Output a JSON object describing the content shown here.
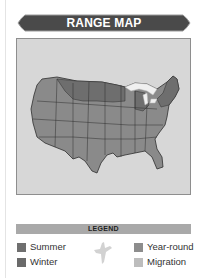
{
  "header": {
    "title": "RANGE MAP"
  },
  "map": {
    "region": "United States (contiguous)",
    "highlighted_areas": [
      "northern-plains",
      "great-lakes",
      "northeast"
    ],
    "colors": {
      "base": "#8a8a8a",
      "summer": "#6e6e6e",
      "background": "#d7d7d7",
      "lakes": "#f0f0f0"
    }
  },
  "legend": {
    "title": "LEGEND",
    "items": [
      {
        "label": "Summer",
        "color": "#6f6f6f"
      },
      {
        "label": "Winter",
        "color": "#6a6a6a"
      },
      {
        "label": "Year-round",
        "color": "#8d8d8d"
      },
      {
        "label": "Migration",
        "color": "#bdbdbd"
      }
    ],
    "icon": "bird-in-flight-icon"
  }
}
